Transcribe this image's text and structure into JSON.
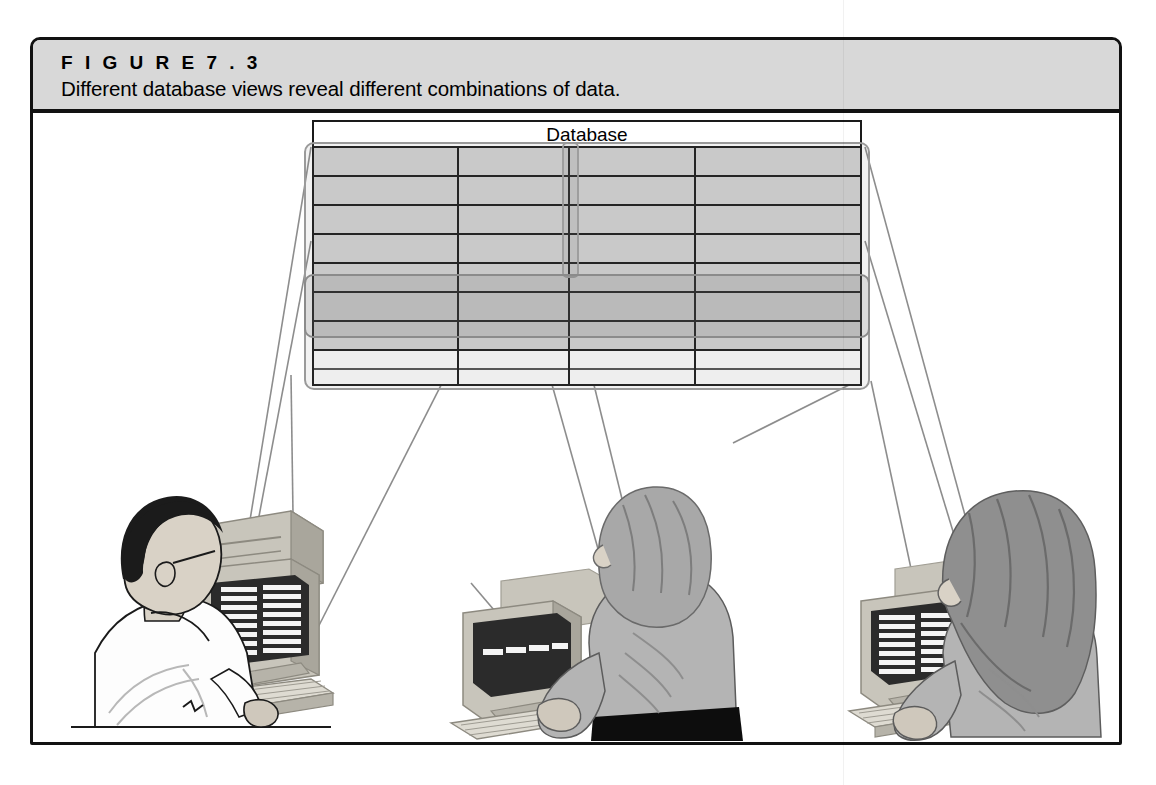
{
  "figure": {
    "label": "F I G U R E   7 . 3",
    "caption": "Different database views reveal different combinations of data."
  },
  "diagram": {
    "table_title": "Database",
    "table": {
      "columns": 4,
      "rows": 9,
      "column_divider_x": [
        455,
        565,
        692
      ],
      "shaded_rows": 7,
      "unshaded_rows": 2
    },
    "highlights": [
      {
        "name": "column-view-highlight",
        "orientation": "vertical",
        "label": "column selection band"
      },
      {
        "name": "row-view-highlight",
        "orientation": "horizontal",
        "label": "row selection band"
      },
      {
        "name": "whole-table-highlight",
        "orientation": "full",
        "label": "entire table selection"
      }
    ],
    "workstations": [
      {
        "name": "left-user",
        "person": "man with dark hair in white shirt, back view",
        "screen_view": "column view: two columns of records",
        "screen_columns": 2,
        "screen_rows": 8
      },
      {
        "name": "center-user",
        "person": "woman with shoulder-length hair, gray top and black skirt",
        "screen_view": "row view: a single horizontal record row",
        "screen_columns": 4,
        "screen_rows": 1
      },
      {
        "name": "right-user",
        "person": "woman with long wavy dark hair in gray top",
        "screen_view": "full table view: two columns of records",
        "screen_columns": 2,
        "screen_rows": 8
      }
    ]
  },
  "colors": {
    "frame_border": "#111111",
    "caption_band": "#d8d8d8",
    "table_shade": "#d2d2d2",
    "table_shade_dark": "#bcbcbc",
    "grid_line": "#1a1a1a",
    "highlight_outline": "#9a9a9a",
    "connector_line": "#8d8d8d",
    "skin": "#d9d2c6",
    "hair_dark": "#1b1b1b",
    "hair_gray": "#a8a8a8",
    "shirt_white": "#fdfdfd",
    "top_gray": "#b4b4b4",
    "skirt_black": "#0d0d0d",
    "monitor_case": "#c8c5bb",
    "monitor_case_shadow": "#a9a69c",
    "screen_dark": "#2b2b2b"
  }
}
